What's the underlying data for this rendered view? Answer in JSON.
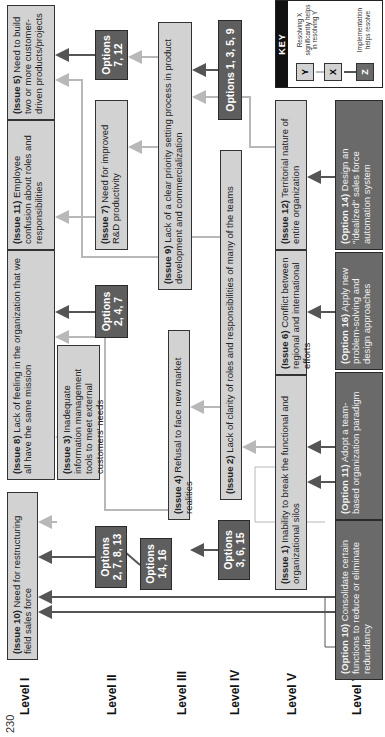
{
  "page_number": "230",
  "levels": [
    "Level I",
    "Level II",
    "Level III",
    "Level IV",
    "Level V",
    "Level VI"
  ],
  "issues": {
    "issue10": {
      "tag": "(Issue 10)",
      "text": " Need for restructuring field sales force"
    },
    "issue8": {
      "tag": "(Issue 8)",
      "text": " Lack of feeling in the organization that we all have the same mission"
    },
    "issue11": {
      "tag": "(Issue 11)",
      "text": " Employee confusion about roles and responsibilities"
    },
    "issue5": {
      "tag": "(Issue 5)",
      "text": " Need to build two or more customer-driven products/projects"
    },
    "issue3": {
      "tag": "(Issue 3)",
      "text": " Inadequate information management tools to meet external customers' needs"
    },
    "issue7": {
      "tag": "(Issue 7)",
      "text": " Need for improved R&D productivity"
    },
    "issue4": {
      "tag": "(Issue 4)",
      "text": " Refusal to face new market realities"
    },
    "issue9": {
      "tag": "(Issue 9)",
      "text": " Lack of a clear priority setting process in product development and commercialization"
    },
    "issue2": {
      "tag": "(Issue 2)",
      "text": " Lack of clarity of roles and responsibilities of many of the teams"
    },
    "issue1": {
      "tag": "(Issue 1)",
      "text": " Inability to break the functional and organizational silos"
    },
    "issue6": {
      "tag": "(Issue 6)",
      "text": " Conflict between regional and international efforts"
    },
    "issue12": {
      "tag": "(Issue 12)",
      "text": " Territorial nature of entire organization"
    }
  },
  "option_groups": {
    "g_2_7_8_13": {
      "title": "Options",
      "nums": "2, 7, 8, 13"
    },
    "g_14_16": {
      "title": "Options",
      "nums": "14, 16"
    },
    "g_2_4_7": {
      "title": "Options",
      "nums": "2, 4, 7"
    },
    "g_7_12": {
      "title": "Options",
      "nums": "7, 12"
    },
    "g_3_6_15": {
      "title": "Options",
      "nums": "3, 6, 15"
    },
    "g_1_3_5_9": {
      "title": "Options 1, 3, 5, 9",
      "nums": ""
    }
  },
  "options": {
    "option10": {
      "tag": "(Option 10)",
      "text": " Consolidate certain functions to reduce or eliminate redundancy"
    },
    "option11": {
      "tag": "(Option 11)",
      "text": " Adopt a team-based organization paradigm"
    },
    "option16": {
      "tag": "(Option 16)",
      "text": " Apply new problem-solving and design approaches"
    },
    "option14": {
      "tag": "(Option 14)",
      "text": " Design an \"idealized\" sales force automation system"
    }
  },
  "key": {
    "title": "KEY",
    "y_label": "Y",
    "x_label": "X",
    "z_label": "Z",
    "resolve_text": "Resolving X significantly helps in resolving Y",
    "impl_text": "Implementation helps resolve"
  },
  "colors": {
    "issue_fill": "#d2d2d2",
    "option_fill": "#6a6a6a",
    "light_arrow": "#b8b8b8",
    "dark_arrow": "#555555"
  }
}
